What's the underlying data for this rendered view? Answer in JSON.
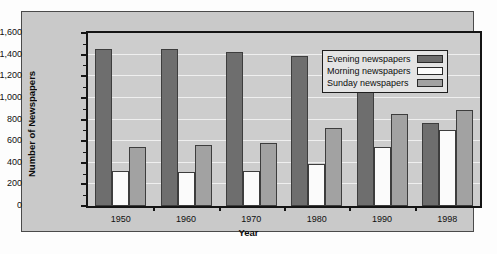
{
  "chart_data": {
    "type": "bar",
    "title": "",
    "xlabel": "Year",
    "ylabel": "Number of Newspapers",
    "categories": [
      "1950",
      "1960",
      "1970",
      "1980",
      "1990",
      "1998"
    ],
    "series": [
      {
        "name": "Evening newspapers",
        "color": "#6e6e6e",
        "values": [
          1450,
          1455,
          1425,
          1385,
          1080,
          770
        ]
      },
      {
        "name": "Morning newspapers",
        "color": "#fbfbfb",
        "values": [
          322,
          310,
          325,
          385,
          550,
          700
        ]
      },
      {
        "name": "Sunday newspapers",
        "color": "#a2a2a2",
        "values": [
          547,
          560,
          580,
          725,
          855,
          885
        ]
      }
    ],
    "ylim": [
      0,
      1600
    ],
    "ytick_labels": [
      "0",
      "200",
      "400",
      "600",
      "800",
      "1,000",
      "1,200",
      "1,400",
      "1,600"
    ],
    "ytick_values": [
      0,
      200,
      400,
      600,
      800,
      1000,
      1200,
      1400,
      1600
    ],
    "ytick_minor_step": 100,
    "grid": true,
    "legend_position": "upper right",
    "legend_entries": [
      "Evening newspapers",
      "Morning newspapers",
      "Sunday newspapers"
    ],
    "plot_background": "#cdcdcd",
    "panel_background": "#c9c9c9",
    "gridline_color": "#efefef",
    "axis_color": "#141414"
  }
}
